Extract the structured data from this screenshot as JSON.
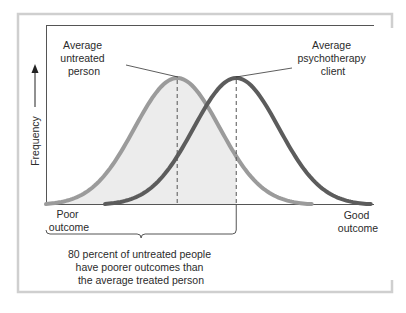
{
  "chart_data": {
    "type": "line",
    "title": "",
    "xlabel": "",
    "ylabel": "Frequency",
    "x_axis_left_label": [
      "Poor",
      "outcome"
    ],
    "x_axis_right_label": [
      "Good",
      "outcome"
    ],
    "xlim": [
      0,
      100
    ],
    "ylim": [
      0,
      1
    ],
    "grid": false,
    "series": [
      {
        "name": "Untreated people",
        "distribution": "normal",
        "mean": 40,
        "sd": 13,
        "peak": 1.0,
        "support": [
          0,
          81
        ],
        "color": "#9b9b9b",
        "annotation": [
          "Average",
          "untreated",
          "person"
        ]
      },
      {
        "name": "Psychotherapy clients",
        "distribution": "normal",
        "mean": 58,
        "sd": 13,
        "peak": 1.0,
        "support": [
          18,
          99
        ],
        "color": "#5c5c5c",
        "annotation": [
          "Average",
          "psychotherapy",
          "client"
        ]
      }
    ],
    "shaded_region": {
      "under_series": "Untreated people",
      "x_range": [
        0,
        58
      ],
      "color": "#ececec"
    },
    "brace_annotation": {
      "x_range": [
        0,
        58
      ],
      "text": [
        "80 percent of untreated people",
        "have poorer outcomes than",
        "the average treated person"
      ]
    }
  }
}
